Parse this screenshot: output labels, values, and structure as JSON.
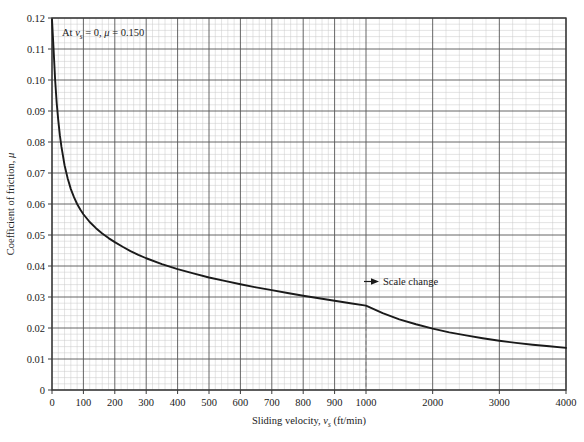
{
  "chart_data": {
    "type": "line",
    "title": "",
    "xlabel": "Sliding velocity, v_s (ft/min)",
    "ylabel": "Coefficient of friction, μ",
    "xlabel_parts": {
      "pre": "Sliding velocity, ",
      "var": "v",
      "sub": "s",
      "post": " (ft/min)"
    },
    "ylabel_parts": {
      "pre": "Coefficient of friction, ",
      "var": "μ"
    },
    "x_ticks": [
      "0",
      "100",
      "200",
      "300",
      "400",
      "500",
      "600",
      "700",
      "800",
      "900",
      "1000",
      "2000",
      "3000",
      "4000"
    ],
    "x_tick_values": [
      0,
      100,
      200,
      300,
      400,
      500,
      600,
      700,
      800,
      900,
      1000,
      2000,
      3000,
      4000
    ],
    "y_ticks": [
      "0",
      "0.01",
      "0.02",
      "0.03",
      "0.04",
      "0.05",
      "0.06",
      "0.07",
      "0.08",
      "0.09",
      "0.10",
      "0.11",
      "0.12"
    ],
    "y_tick_values": [
      0,
      0.01,
      0.02,
      0.03,
      0.04,
      0.05,
      0.06,
      0.07,
      0.08,
      0.09,
      0.1,
      0.11,
      0.12
    ],
    "xlim": [
      0,
      4000
    ],
    "ylim": [
      0,
      0.12
    ],
    "grid": true,
    "minor_grid": true,
    "minor_divisions": 5,
    "legend": "none",
    "scale_break_at": 1000,
    "series": [
      {
        "name": "Coefficient of friction vs sliding velocity",
        "color": "#1a1a1a",
        "x": [
          0,
          5,
          10,
          15,
          20,
          25,
          30,
          40,
          50,
          60,
          70,
          80,
          90,
          100,
          120,
          140,
          160,
          180,
          200,
          225,
          250,
          275,
          300,
          350,
          400,
          450,
          500,
          550,
          600,
          650,
          700,
          750,
          800,
          850,
          900,
          950,
          1000,
          1250,
          1500,
          1750,
          2000,
          2250,
          2500,
          2750,
          3000,
          3250,
          3500,
          3750,
          4000
        ],
        "y": [
          0.1195,
          0.11,
          0.1,
          0.0925,
          0.087,
          0.0822,
          0.0785,
          0.0725,
          0.0682,
          0.0648,
          0.0622,
          0.06,
          0.0582,
          0.0567,
          0.0542,
          0.0522,
          0.0505,
          0.049,
          0.0477,
          0.0462,
          0.0448,
          0.0436,
          0.0425,
          0.0406,
          0.039,
          0.0376,
          0.0363,
          0.0352,
          0.0341,
          0.0331,
          0.0322,
          0.0313,
          0.0304,
          0.0296,
          0.0288,
          0.028,
          0.0272,
          0.0248,
          0.0228,
          0.0212,
          0.0198,
          0.0186,
          0.0176,
          0.0167,
          0.0159,
          0.0152,
          0.0146,
          0.0141,
          0.0136
        ]
      }
    ],
    "annotations": [
      {
        "name": "zero-velocity-note",
        "text": "At v_s = 0, μ = 0.150",
        "parts": {
          "pre": "At ",
          "var1": "v",
          "sub1": "s",
          "mid": " = 0, ",
          "var2": "μ",
          "post": " = 0.150"
        },
        "x_px": 62,
        "y_px": 36
      },
      {
        "name": "scale-change-note",
        "text": "Scale change",
        "arrow": "►",
        "x_px": 380,
        "y_px": 285
      }
    ],
    "colors": {
      "curve": "#1a1a1a",
      "axis": "#3a3a3a",
      "major_grid": "#555555",
      "minor_grid": "#c9c9c9",
      "background": "#ffffff",
      "dashed_marker": "#8a8a8a"
    }
  }
}
